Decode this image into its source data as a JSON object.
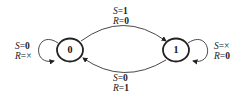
{
  "diagram": {
    "type": "state-machine",
    "states": [
      {
        "id": "s0",
        "label": "0"
      },
      {
        "id": "s1",
        "label": "1"
      }
    ],
    "transitions": [
      {
        "from": "0",
        "to": "1",
        "s_var": "S",
        "s_val": "1",
        "r_var": "R",
        "r_val": "0"
      },
      {
        "from": "1",
        "to": "0",
        "s_var": "S",
        "s_val": "0",
        "r_var": "R",
        "r_val": "1"
      },
      {
        "from": "0",
        "to": "0",
        "s_var": "S",
        "s_val": "0",
        "r_var": "R",
        "r_val": "×"
      },
      {
        "from": "1",
        "to": "1",
        "s_var": "S",
        "s_val": "×",
        "r_var": "R",
        "r_val": "0"
      }
    ]
  }
}
